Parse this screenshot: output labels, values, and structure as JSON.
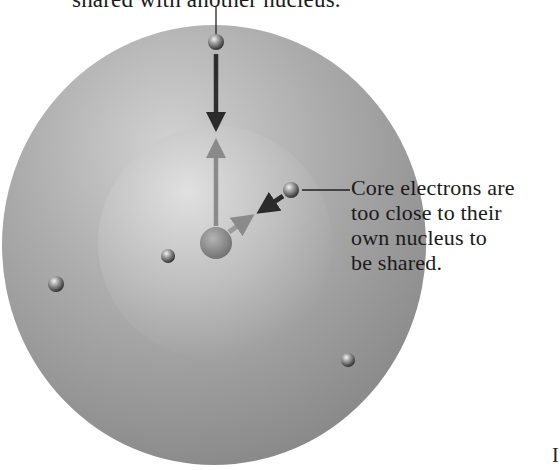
{
  "labels": {
    "top_caption": "shared with another nucleus.",
    "core_caption_lines": [
      "Core electrons are",
      "too close to their",
      "own nucleus to",
      "be shared."
    ],
    "page_mark": "I"
  },
  "diagram": {
    "outer_shell": {
      "cx": 214,
      "cy": 245,
      "rx": 212,
      "ry": 220,
      "color": "#9a9a9a"
    },
    "inner_shell": {
      "cx": 215,
      "cy": 243,
      "r": 117,
      "color": "#c4c4c4"
    },
    "nucleus": {
      "cx": 216,
      "cy": 243,
      "r": 16,
      "color": "#8c8c8c"
    },
    "electrons": [
      {
        "name": "valence-electron-top",
        "cx": 216,
        "cy": 42,
        "r": 8
      },
      {
        "name": "core-electron-upper-right",
        "cx": 291,
        "cy": 190,
        "r": 8
      },
      {
        "name": "core-electron-inner-left",
        "cx": 168,
        "cy": 256,
        "r": 7
      },
      {
        "name": "valence-electron-left",
        "cx": 56,
        "cy": 284,
        "r": 8
      },
      {
        "name": "valence-electron-lower-right",
        "cx": 348,
        "cy": 360,
        "r": 7
      }
    ],
    "arrows": [
      {
        "name": "valence-attraction-arrow",
        "x1": 216,
        "y1": 54,
        "x2": 216,
        "y2": 132,
        "color": "#2e2e2e"
      },
      {
        "name": "nucleus-pull-up-arrow",
        "x1": 216,
        "y1": 226,
        "x2": 216,
        "y2": 138,
        "color": "#8a8a8a"
      },
      {
        "name": "core-attraction-arrow",
        "x1": 283,
        "y1": 196,
        "x2": 257,
        "y2": 213,
        "color": "#2a2a2a"
      },
      {
        "name": "nucleus-pull-core-arrow",
        "x1": 229,
        "y1": 232,
        "x2": 254,
        "y2": 214,
        "color": "#8f8f8f"
      }
    ],
    "leader_lines": [
      {
        "name": "top-caption-leader",
        "x1": 216,
        "y1": 7,
        "x2": 216,
        "y2": 34
      },
      {
        "name": "core-caption-leader",
        "x1": 302,
        "y1": 190,
        "x2": 350,
        "y2": 190
      }
    ]
  }
}
